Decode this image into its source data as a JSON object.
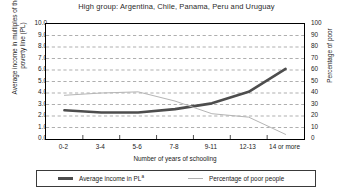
{
  "chart_data": {
    "type": "line",
    "title": "High group: Argentina, Chile, Panama, Peru and Uruguay",
    "xlabel": "Number of years of schooling",
    "categories": [
      "0-2",
      "3-4",
      "5-6",
      "7-8",
      "9-11",
      "12-13",
      "14 or more"
    ],
    "grid": true,
    "legend_position": "bottom",
    "axes": {
      "left": {
        "label": "Average income in multiples of the poverty line (PL)",
        "ylim": [
          0.0,
          10.0
        ],
        "tick_step": 1.0,
        "ticks": [
          "10.0",
          "9.0",
          "8.0",
          "7.0",
          "6.0",
          "5.0",
          "4.0",
          "3.0",
          "2.0",
          "1.0",
          "0.0"
        ]
      },
      "right": {
        "label": "Percentage of poor",
        "ylim": [
          0,
          100
        ],
        "tick_step": 10,
        "ticks": [
          "100",
          "90",
          "80",
          "70",
          "60",
          "50",
          "40",
          "30",
          "20",
          "10",
          "0"
        ]
      }
    },
    "series": [
      {
        "name": "Average income in PL",
        "legend_label": "Average income in PL",
        "legend_superscript": "a",
        "axis": "left",
        "color": "#4d4d4d",
        "width": 2.6,
        "values": [
          2.5,
          2.3,
          2.3,
          2.6,
          3.1,
          4.1,
          6.1
        ]
      },
      {
        "name": "Percentage of poor people",
        "legend_label": "Percentage of poor people",
        "axis": "right",
        "color": "#b5b5b5",
        "width": 1.0,
        "values": [
          38,
          40,
          41,
          33,
          22,
          19,
          4
        ]
      }
    ]
  },
  "legend": {
    "entries": [
      {
        "label": "Average income in PL",
        "superscript": "a"
      },
      {
        "label": "Percentage of poor people"
      }
    ]
  }
}
